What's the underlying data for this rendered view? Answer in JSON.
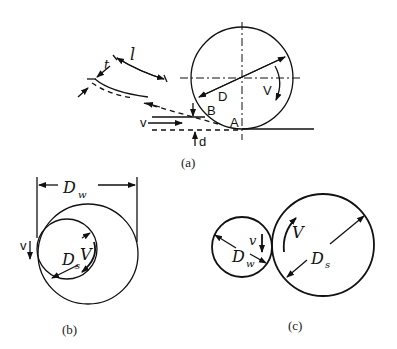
{
  "figure_a": {
    "caption": "(a)",
    "labels": {
      "D": "D",
      "V": "V",
      "B": "B",
      "A": "A",
      "v": "v",
      "d": "d",
      "t": "t",
      "l": "l"
    }
  },
  "figure_b": {
    "caption": "(b)",
    "labels": {
      "Dw": "D",
      "Dw_sub": "w",
      "Ds": "D",
      "Ds_sub": "s",
      "V": "V",
      "v": "v"
    }
  },
  "figure_c": {
    "caption": "(c)",
    "labels": {
      "Dw": "D",
      "Dw_sub": "w",
      "Ds": "D",
      "Ds_sub": "s",
      "V": "V",
      "v": "v"
    }
  },
  "colors": {
    "ink": "#111111",
    "background": "#ffffff"
  }
}
